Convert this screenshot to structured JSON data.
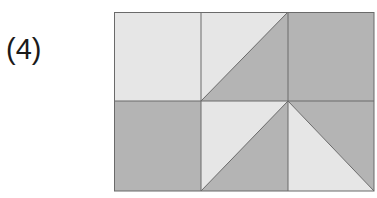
{
  "label": "(4)",
  "colors": {
    "light": "#e6e6e6",
    "dark": "#b4b4b4",
    "line": "#6a6a6a"
  },
  "grid": {
    "rows": 2,
    "cols": 3,
    "cells": [
      {
        "row": 0,
        "col": 0,
        "type": "solid",
        "fill": "light"
      },
      {
        "row": 0,
        "col": 1,
        "type": "diagonal-bl-tr",
        "upper_left": "light",
        "lower_right": "dark"
      },
      {
        "row": 0,
        "col": 2,
        "type": "solid",
        "fill": "dark"
      },
      {
        "row": 1,
        "col": 0,
        "type": "solid",
        "fill": "dark"
      },
      {
        "row": 1,
        "col": 1,
        "type": "diagonal-bl-tr",
        "upper_left": "light",
        "lower_right": "dark"
      },
      {
        "row": 1,
        "col": 2,
        "type": "diagonal-tl-br",
        "upper_right": "dark",
        "lower_left": "light"
      }
    ]
  }
}
